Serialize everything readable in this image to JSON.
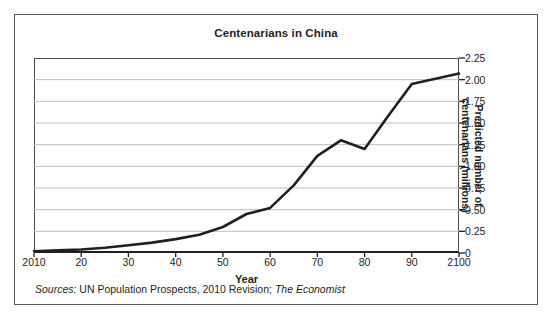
{
  "figure": {
    "title": "Centenarians in China",
    "sources_prefix": "Sources:",
    "sources_mid": " UN Population Prospects, 2010 Revision; ",
    "sources_italic_tail": "The Economist",
    "border_color": "#58595b",
    "background": "#ffffff"
  },
  "axes": {
    "x_title": "Year",
    "y_title_line1": "Predicted number of",
    "y_title_line2": "centenarians (millions)",
    "x_tick_labels": [
      "2010",
      "20",
      "30",
      "40",
      "50",
      "60",
      "70",
      "80",
      "90",
      "2100"
    ],
    "y_tick_labels": [
      "2.25",
      "2.00",
      "1.75",
      "1.50",
      "1.25",
      "1.00",
      "0.75",
      "0.50",
      "0.25",
      "0"
    ],
    "grid_color": "#bcbec0",
    "axis_color": "#231f20",
    "line_color": "#231f20"
  },
  "chart_data": {
    "type": "line",
    "title": "Centenarians in China",
    "xlabel": "Year",
    "ylabel": "Predicted number of centenarians (millions)",
    "xlim": [
      2010,
      2100
    ],
    "ylim": [
      0,
      2.25
    ],
    "ytick_values": [
      0,
      0.25,
      0.5,
      0.75,
      1.0,
      1.25,
      1.5,
      1.75,
      2.0,
      2.25
    ],
    "xtick_values": [
      2010,
      2020,
      2030,
      2040,
      2050,
      2060,
      2070,
      2080,
      2090,
      2100
    ],
    "grid": "horizontal",
    "legend": "none",
    "series": [
      {
        "name": "Predicted number of centenarians (millions)",
        "x": [
          2010,
          2015,
          2020,
          2025,
          2030,
          2035,
          2040,
          2045,
          2050,
          2055,
          2060,
          2065,
          2070,
          2075,
          2080,
          2085,
          2090,
          2095,
          2100
        ],
        "values": [
          0.02,
          0.03,
          0.04,
          0.06,
          0.09,
          0.12,
          0.16,
          0.21,
          0.3,
          0.45,
          0.52,
          0.78,
          1.12,
          1.3,
          1.2,
          1.58,
          1.95,
          2.01,
          2.07
        ]
      }
    ],
    "source": "Sources: UN Population Prospects, 2010 Revision; The Economist"
  }
}
